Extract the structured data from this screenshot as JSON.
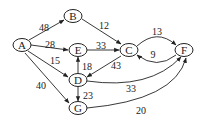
{
  "graph": {
    "type": "directed-weighted",
    "nodes": [
      {
        "id": "A",
        "label": "A",
        "x": 22,
        "y": 45
      },
      {
        "id": "B",
        "label": "B",
        "x": 73,
        "y": 16
      },
      {
        "id": "E",
        "label": "E",
        "x": 78,
        "y": 50
      },
      {
        "id": "C",
        "label": "C",
        "x": 129,
        "y": 50
      },
      {
        "id": "F",
        "label": "F",
        "x": 184,
        "y": 50
      },
      {
        "id": "D",
        "label": "D",
        "x": 78,
        "y": 80
      },
      {
        "id": "G",
        "label": "G",
        "x": 78,
        "y": 108
      }
    ],
    "edges": [
      {
        "from": "A",
        "to": "B",
        "weight": "48"
      },
      {
        "from": "A",
        "to": "E",
        "weight": "28"
      },
      {
        "from": "A",
        "to": "D",
        "weight": "15"
      },
      {
        "from": "A",
        "to": "G",
        "weight": "40"
      },
      {
        "from": "B",
        "to": "C",
        "weight": "12"
      },
      {
        "from": "E",
        "to": "C",
        "weight": "33"
      },
      {
        "from": "C",
        "to": "D",
        "weight": "43"
      },
      {
        "from": "D",
        "to": "E",
        "weight": "18"
      },
      {
        "from": "D",
        "to": "G",
        "weight": "23"
      },
      {
        "from": "C",
        "to": "F",
        "weight": "13"
      },
      {
        "from": "F",
        "to": "C",
        "weight": "9"
      },
      {
        "from": "D",
        "to": "F",
        "weight": "33"
      },
      {
        "from": "G",
        "to": "F",
        "weight": "20"
      }
    ]
  }
}
